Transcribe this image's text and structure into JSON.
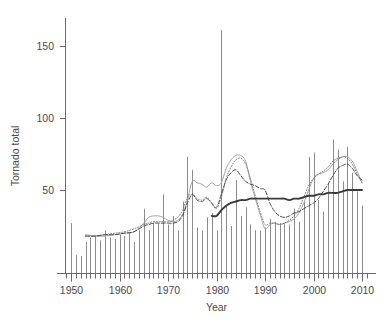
{
  "chart_data": {
    "type": "bar",
    "title": "",
    "subtitle": "",
    "xlabel": "Year",
    "ylabel": "Tornado total",
    "xlim": [
      1948,
      2011
    ],
    "ylim": [
      0,
      170
    ],
    "xticks": [
      1950,
      1960,
      1970,
      1980,
      1990,
      2000,
      2010
    ],
    "xtick_labels": [
      "1950",
      "1960",
      "1970",
      "1980",
      "1990",
      "2000",
      "2010"
    ],
    "yticks": [
      50,
      100,
      150
    ],
    "ytick_labels": [
      "50",
      "100",
      "150"
    ],
    "minor_xticks_every": 1,
    "grid": false,
    "legend": "none",
    "colors": {
      "bars": "#8c8c8c",
      "solid_thin": "#9a9a9a",
      "dotted": "#6e6e6e",
      "dashed": "#4a4a4a",
      "solid_thick": "#3a3a3a",
      "axis": "#6a6a6a",
      "text": "#4a4a4a",
      "background": "#ffffff"
    },
    "categories": [
      1950,
      1951,
      1952,
      1953,
      1954,
      1955,
      1956,
      1957,
      1958,
      1959,
      1960,
      1961,
      1962,
      1963,
      1964,
      1965,
      1966,
      1967,
      1968,
      1969,
      1970,
      1971,
      1972,
      1973,
      1974,
      1975,
      1976,
      1977,
      1978,
      1979,
      1980,
      1981,
      1982,
      1983,
      1984,
      1985,
      1986,
      1987,
      1988,
      1989,
      1990,
      1991,
      1992,
      1993,
      1994,
      1995,
      1996,
      1997,
      1998,
      1999,
      2000,
      2001,
      2002,
      2003,
      2004,
      2005,
      2006,
      2007,
      2008,
      2009,
      2010
    ],
    "values": [
      27,
      5,
      4,
      14,
      17,
      18,
      15,
      22,
      17,
      16,
      19,
      18,
      21,
      14,
      22,
      37,
      22,
      27,
      27,
      47,
      26,
      32,
      22,
      42,
      73,
      64,
      24,
      22,
      31,
      34,
      22,
      161,
      39,
      25,
      57,
      32,
      38,
      26,
      22,
      22,
      24,
      30,
      28,
      27,
      27,
      26,
      37,
      28,
      42,
      73,
      76,
      43,
      35,
      55,
      85,
      78,
      56,
      80,
      62,
      49,
      39
    ],
    "series": [
      {
        "name": "solid-thin-smooth",
        "style": "solid-thin",
        "x": [
          1953,
          1955,
          1957,
          1959,
          1961,
          1963,
          1965,
          1966,
          1967,
          1968,
          1969,
          1970,
          1971,
          1972,
          1973,
          1974,
          1975,
          1976,
          1977,
          1978,
          1979,
          1980,
          1981,
          1982,
          1983,
          1984,
          1985,
          1986,
          1987,
          1988,
          1989,
          1990,
          1991,
          1992,
          1993,
          1994,
          1995,
          1996,
          1997,
          1998,
          1999,
          2000,
          2001,
          2002,
          2003,
          2004,
          2005,
          2006,
          2007,
          2008,
          2009,
          2010
        ],
        "values": [
          19,
          18,
          18,
          19,
          20,
          21,
          27,
          31,
          32,
          32,
          31,
          29,
          28,
          29,
          33,
          43,
          56,
          55,
          54,
          52,
          55,
          53,
          55,
          65,
          71,
          74,
          74,
          70,
          56,
          44,
          33,
          23,
          26,
          27,
          26,
          27,
          28,
          30,
          34,
          41,
          50,
          58,
          61,
          62,
          64,
          68,
          71,
          73,
          73,
          70,
          63,
          55
        ]
      },
      {
        "name": "dotted-smooth",
        "style": "dotted",
        "x": [
          1953,
          1955,
          1957,
          1959,
          1961,
          1963,
          1965,
          1966,
          1967,
          1968,
          1969,
          1970,
          1971,
          1972,
          1973,
          1974,
          1975,
          1976,
          1977,
          1978,
          1979,
          1980,
          1981,
          1982,
          1983,
          1984,
          1985,
          1986,
          1987,
          1988,
          1989,
          1990,
          1991,
          1992,
          1993,
          1994,
          1995,
          1996,
          1997,
          1998,
          1999,
          2000,
          2001,
          2002,
          2003,
          2004,
          2005,
          2006,
          2007,
          2008,
          2009,
          2010
        ],
        "values": [
          18,
          18,
          19,
          20,
          21,
          23,
          26,
          27,
          28,
          28,
          28,
          28,
          29,
          31,
          36,
          45,
          47,
          44,
          43,
          45,
          41,
          37,
          45,
          58,
          66,
          71,
          72,
          68,
          58,
          46,
          35,
          26,
          27,
          27,
          26,
          27,
          29,
          32,
          37,
          45,
          53,
          58,
          61,
          63,
          66,
          70,
          72,
          73,
          72,
          68,
          61,
          55
        ]
      },
      {
        "name": "dashed-smooth",
        "style": "dashed",
        "x": [
          1953,
          1955,
          1957,
          1959,
          1961,
          1963,
          1965,
          1966,
          1967,
          1968,
          1969,
          1970,
          1971,
          1972,
          1973,
          1974,
          1975,
          1976,
          1977,
          1978,
          1979,
          1980,
          1981,
          1982,
          1983,
          1984,
          1985,
          1986,
          1987,
          1988,
          1989,
          1990,
          1991,
          1992,
          1993,
          1994,
          1995,
          1996,
          1997,
          1998,
          1999,
          2000,
          2001,
          2002,
          2003,
          2004,
          2005,
          2006,
          2007,
          2008,
          2009,
          2010
        ],
        "values": [
          18,
          18,
          19,
          19,
          20,
          21,
          25,
          26,
          27,
          27,
          27,
          27,
          27,
          28,
          32,
          41,
          47,
          43,
          42,
          44,
          41,
          38,
          47,
          57,
          62,
          64,
          60,
          56,
          54,
          53,
          51,
          50,
          41,
          35,
          32,
          31,
          32,
          34,
          35,
          37,
          39,
          41,
          44,
          49,
          54,
          60,
          65,
          67,
          68,
          65,
          60,
          57
        ]
      },
      {
        "name": "solid-thick-trend",
        "style": "solid-thick",
        "x": [
          1979,
          1980,
          1981,
          1982,
          1983,
          1984,
          1985,
          1986,
          1987,
          1988,
          1989,
          1990,
          1991,
          1992,
          1993,
          1994,
          1995,
          1996,
          1997,
          1998,
          1999,
          2000,
          2001,
          2002,
          2003,
          2004,
          2005,
          2006,
          2007,
          2008,
          2009,
          2010
        ],
        "values": [
          32,
          32,
          36,
          39,
          41,
          42,
          43,
          43,
          44,
          44,
          44,
          44,
          44,
          44,
          44,
          44,
          43,
          44,
          44,
          45,
          46,
          46,
          47,
          47,
          48,
          48,
          48,
          49,
          50,
          50,
          50,
          50
        ]
      }
    ]
  },
  "axes": {
    "y_title": "Tornado total",
    "x_title": "Year"
  }
}
